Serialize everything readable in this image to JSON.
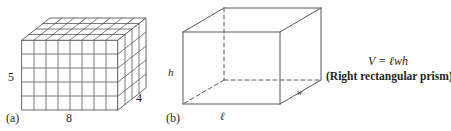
{
  "figure_a": {
    "caption": "(a)",
    "label_height": "5",
    "label_width": "8",
    "label_depth": "4",
    "description": "unit-cube rectangular prism 8 by 5 by 4",
    "grid": {
      "columns": 8,
      "rows": 5,
      "depth": 4
    },
    "stroke_color": "#58595b"
  },
  "figure_b": {
    "caption": "(b)",
    "label_height": "h",
    "label_length": "ℓ",
    "label_width": "w",
    "description": "wireframe right rectangular prism with hidden edges dashed",
    "stroke_color": "#58595b"
  },
  "formula": {
    "equation": "V = ℓwh",
    "caption": "(Right rectangular prism)"
  },
  "colors": {
    "background": "#ffffff",
    "ink": "#231f20",
    "line": "#58595b",
    "line_light": "#8c8c8e"
  }
}
